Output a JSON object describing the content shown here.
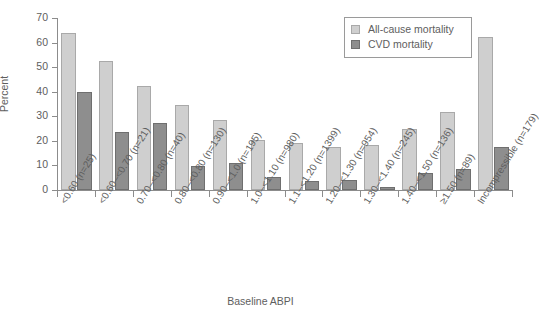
{
  "chart_data": {
    "type": "bar",
    "title": "",
    "xlabel": "Baseline ABPI",
    "ylabel": "Percent",
    "ylim": [
      0,
      70
    ],
    "yticks": [
      0,
      10,
      20,
      30,
      40,
      50,
      60,
      70
    ],
    "grid": false,
    "legend_position": "top-right",
    "categories": [
      "<0.60 (n=25)",
      "<0.60–<0.70 (n=21)",
      "0.70–<0.80 (n=40)",
      "0.80–<0.80 (n=130)",
      "0.90–<1.0 (n=195)",
      "1.0–<1.10 (n=980)",
      "1.1–<1.20 (n=1399)",
      "1.20–<1.30 (n=954)",
      "1.30–<1.40 (n=245)",
      "1.40–<1.50 (n=136)",
      "≥1.50 (n=89)",
      "Incompressible (n=179)"
    ],
    "series": [
      {
        "name": "All-cause mortality",
        "color": "#cfcfcf",
        "values": [
          64.1,
          52.4,
          42.2,
          34.4,
          28.3,
          20.3,
          19.0,
          17.6,
          18.5,
          24.8,
          31.6,
          62.2
        ]
      },
      {
        "name": "CVD mortality",
        "color": "#8e8e8e",
        "values": [
          39.8,
          23.6,
          27.2,
          9.8,
          10.8,
          5.1,
          3.5,
          4.2,
          1.1,
          7.1,
          8.7,
          17.4
        ]
      }
    ]
  },
  "legend": {
    "items": [
      {
        "label": "All-cause mortality",
        "swatch": "light"
      },
      {
        "label": "CVD mortality",
        "swatch": "dark"
      }
    ]
  },
  "axes": {
    "y_title": "Percent",
    "x_title": "Baseline ABPI"
  },
  "colors": {
    "background": "#ffffff",
    "axis": "#8c8c8c",
    "text": "#5e5e5e",
    "series_light_fill": "#cfcfcf",
    "series_light_stroke": "#a9a9a9",
    "series_dark_fill": "#8e8e8e",
    "series_dark_stroke": "#6f6f6f"
  }
}
